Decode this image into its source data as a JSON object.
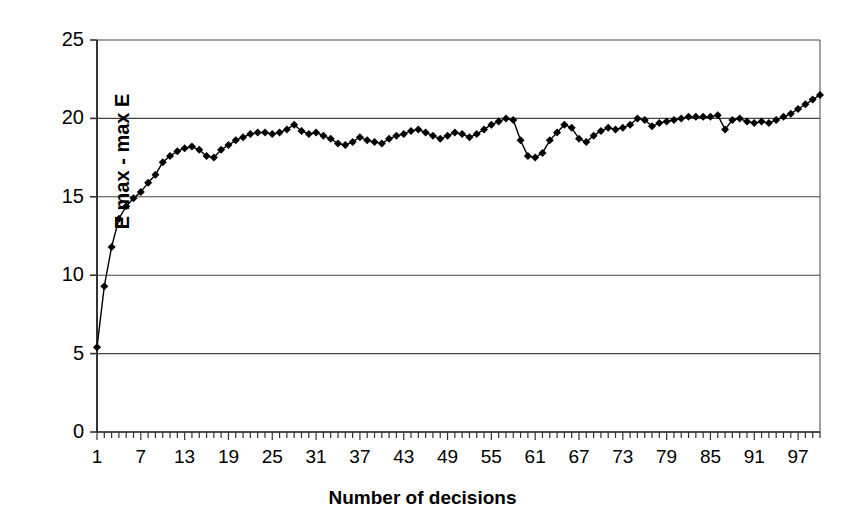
{
  "chart_data": {
    "type": "line",
    "title": "",
    "subtitle": "",
    "xlabel": "Number of decisions",
    "ylabel": "E max - max E",
    "xlim": [
      1,
      100
    ],
    "ylim": [
      0,
      25
    ],
    "ytick_labels": [
      "0",
      "5",
      "10",
      "15",
      "20",
      "25"
    ],
    "ytick_values": [
      0,
      5,
      10,
      15,
      20,
      25
    ],
    "xtick_labels": [
      "1",
      "7",
      "13",
      "19",
      "25",
      "31",
      "37",
      "43",
      "49",
      "55",
      "61",
      "67",
      "73",
      "79",
      "85",
      "91",
      "97"
    ],
    "xtick_values": [
      1,
      7,
      13,
      19,
      25,
      31,
      37,
      43,
      49,
      55,
      61,
      67,
      73,
      79,
      85,
      91,
      97
    ],
    "minor_xticks_step": 1,
    "grid": "horizontal",
    "legend": null,
    "marker": "diamond",
    "marker_color": "#000000",
    "line_color": "#000000",
    "series": [
      {
        "name": "E max - max E",
        "x": [
          1,
          2,
          3,
          4,
          5,
          6,
          7,
          8,
          9,
          10,
          11,
          12,
          13,
          14,
          15,
          16,
          17,
          18,
          19,
          20,
          21,
          22,
          23,
          24,
          25,
          26,
          27,
          28,
          29,
          30,
          31,
          32,
          33,
          34,
          35,
          36,
          37,
          38,
          39,
          40,
          41,
          42,
          43,
          44,
          45,
          46,
          47,
          48,
          49,
          50,
          51,
          52,
          53,
          54,
          55,
          56,
          57,
          58,
          59,
          60,
          61,
          62,
          63,
          64,
          65,
          66,
          67,
          68,
          69,
          70,
          71,
          72,
          73,
          74,
          75,
          76,
          77,
          78,
          79,
          80,
          81,
          82,
          83,
          84,
          85,
          86,
          87,
          88,
          89,
          90,
          91,
          92,
          93,
          94,
          95,
          96,
          97,
          98,
          99,
          100
        ],
        "values": [
          5.4,
          9.3,
          11.8,
          13.6,
          14.4,
          14.9,
          15.3,
          15.9,
          16.4,
          17.2,
          17.6,
          17.9,
          18.1,
          18.2,
          18.0,
          17.6,
          17.5,
          18.0,
          18.3,
          18.6,
          18.8,
          19.0,
          19.1,
          19.1,
          19.0,
          19.1,
          19.3,
          19.6,
          19.2,
          19.0,
          19.1,
          18.9,
          18.7,
          18.4,
          18.3,
          18.5,
          18.8,
          18.6,
          18.5,
          18.4,
          18.7,
          18.9,
          19.0,
          19.2,
          19.3,
          19.1,
          18.9,
          18.7,
          18.9,
          19.1,
          19.0,
          18.8,
          19.0,
          19.3,
          19.6,
          19.8,
          20.0,
          19.9,
          18.6,
          17.6,
          17.5,
          17.8,
          18.6,
          19.1,
          19.6,
          19.4,
          18.7,
          18.5,
          18.9,
          19.2,
          19.4,
          19.3,
          19.4,
          19.6,
          20.0,
          19.9,
          19.5,
          19.7,
          19.8,
          19.9,
          20.0,
          20.1,
          20.1,
          20.1,
          20.1,
          20.2,
          19.3,
          19.9,
          20.0,
          19.8,
          19.7,
          19.8,
          19.7,
          19.9,
          20.1,
          20.3,
          20.6,
          20.9,
          21.2,
          21.5
        ]
      }
    ]
  },
  "axes": {
    "plot_left": 97,
    "plot_right": 820,
    "plot_top": 40,
    "plot_bottom": 432
  }
}
